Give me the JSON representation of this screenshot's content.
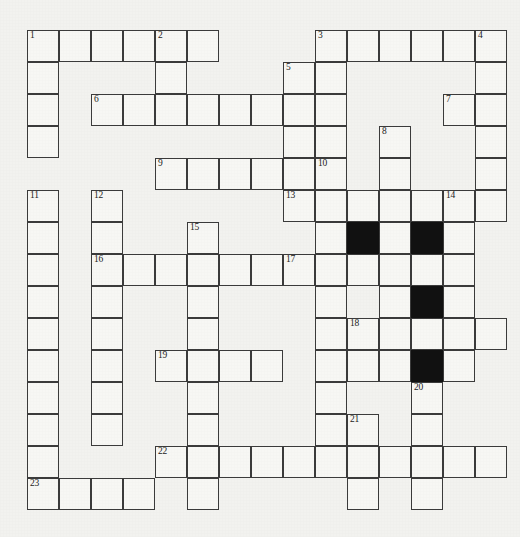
{
  "puzzle": {
    "type": "crossword-grid",
    "title": "Crossword puzzle grid",
    "columns": 15,
    "rows": 16,
    "cell_size": 32,
    "origin_x": 27,
    "origin_y": 30,
    "colors": {
      "page_background": "#f2f2ef",
      "cell_fill": "#f7f7f4",
      "cell_border": "#3b3b3b",
      "block_fill": "#111111",
      "number_color": "#1b1b1b"
    },
    "clue_numbers": [
      {
        "n": "1",
        "col": 0,
        "row": 0
      },
      {
        "n": "2",
        "col": 4,
        "row": 0
      },
      {
        "n": "3",
        "col": 9,
        "row": 0
      },
      {
        "n": "4",
        "col": 14,
        "row": 0
      },
      {
        "n": "5",
        "col": 8,
        "row": 1
      },
      {
        "n": "6",
        "col": 2,
        "row": 2
      },
      {
        "n": "7",
        "col": 13,
        "row": 2
      },
      {
        "n": "8",
        "col": 11,
        "row": 3
      },
      {
        "n": "9",
        "col": 4,
        "row": 4
      },
      {
        "n": "10",
        "col": 9,
        "row": 4
      },
      {
        "n": "11",
        "col": 0,
        "row": 5
      },
      {
        "n": "12",
        "col": 2,
        "row": 5
      },
      {
        "n": "13",
        "col": 8,
        "row": 5
      },
      {
        "n": "14",
        "col": 13,
        "row": 5
      },
      {
        "n": "15",
        "col": 5,
        "row": 6
      },
      {
        "n": "16",
        "col": 2,
        "row": 7
      },
      {
        "n": "17",
        "col": 8,
        "row": 7
      },
      {
        "n": "18",
        "col": 10,
        "row": 9
      },
      {
        "n": "19",
        "col": 4,
        "row": 10
      },
      {
        "n": "20",
        "col": 12,
        "row": 11
      },
      {
        "n": "21",
        "col": 10,
        "row": 12
      },
      {
        "n": "22",
        "col": 4,
        "row": 13
      },
      {
        "n": "23",
        "col": 0,
        "row": 14
      }
    ],
    "blocked_cells": [
      {
        "col": 10,
        "row": 6
      },
      {
        "col": 12,
        "row": 6
      },
      {
        "col": 12,
        "row": 8
      },
      {
        "col": 12,
        "row": 10
      }
    ],
    "open_cells": [
      {
        "col": 0,
        "row": 0
      },
      {
        "col": 1,
        "row": 0
      },
      {
        "col": 2,
        "row": 0
      },
      {
        "col": 3,
        "row": 0
      },
      {
        "col": 4,
        "row": 0
      },
      {
        "col": 5,
        "row": 0
      },
      {
        "col": 9,
        "row": 0
      },
      {
        "col": 10,
        "row": 0
      },
      {
        "col": 11,
        "row": 0
      },
      {
        "col": 12,
        "row": 0
      },
      {
        "col": 13,
        "row": 0
      },
      {
        "col": 14,
        "row": 0
      },
      {
        "col": 0,
        "row": 1
      },
      {
        "col": 4,
        "row": 1
      },
      {
        "col": 8,
        "row": 1
      },
      {
        "col": 9,
        "row": 1
      },
      {
        "col": 14,
        "row": 1
      },
      {
        "col": 0,
        "row": 2
      },
      {
        "col": 2,
        "row": 2
      },
      {
        "col": 3,
        "row": 2
      },
      {
        "col": 4,
        "row": 2
      },
      {
        "col": 5,
        "row": 2
      },
      {
        "col": 6,
        "row": 2
      },
      {
        "col": 7,
        "row": 2
      },
      {
        "col": 8,
        "row": 2
      },
      {
        "col": 9,
        "row": 2
      },
      {
        "col": 13,
        "row": 2
      },
      {
        "col": 14,
        "row": 2
      },
      {
        "col": 0,
        "row": 3
      },
      {
        "col": 8,
        "row": 3
      },
      {
        "col": 9,
        "row": 3
      },
      {
        "col": 11,
        "row": 3
      },
      {
        "col": 14,
        "row": 3
      },
      {
        "col": 4,
        "row": 4
      },
      {
        "col": 5,
        "row": 4
      },
      {
        "col": 6,
        "row": 4
      },
      {
        "col": 7,
        "row": 4
      },
      {
        "col": 8,
        "row": 4
      },
      {
        "col": 9,
        "row": 4
      },
      {
        "col": 11,
        "row": 4
      },
      {
        "col": 14,
        "row": 4
      },
      {
        "col": 0,
        "row": 5
      },
      {
        "col": 2,
        "row": 5
      },
      {
        "col": 8,
        "row": 5
      },
      {
        "col": 9,
        "row": 5
      },
      {
        "col": 10,
        "row": 5
      },
      {
        "col": 11,
        "row": 5
      },
      {
        "col": 12,
        "row": 5
      },
      {
        "col": 13,
        "row": 5
      },
      {
        "col": 14,
        "row": 5
      },
      {
        "col": 0,
        "row": 6
      },
      {
        "col": 2,
        "row": 6
      },
      {
        "col": 5,
        "row": 6
      },
      {
        "col": 9,
        "row": 6
      },
      {
        "col": 11,
        "row": 6
      },
      {
        "col": 13,
        "row": 6
      },
      {
        "col": 0,
        "row": 7
      },
      {
        "col": 2,
        "row": 7
      },
      {
        "col": 3,
        "row": 7
      },
      {
        "col": 4,
        "row": 7
      },
      {
        "col": 5,
        "row": 7
      },
      {
        "col": 6,
        "row": 7
      },
      {
        "col": 7,
        "row": 7
      },
      {
        "col": 8,
        "row": 7
      },
      {
        "col": 9,
        "row": 7
      },
      {
        "col": 10,
        "row": 7
      },
      {
        "col": 11,
        "row": 7
      },
      {
        "col": 12,
        "row": 7
      },
      {
        "col": 13,
        "row": 7
      },
      {
        "col": 0,
        "row": 8
      },
      {
        "col": 2,
        "row": 8
      },
      {
        "col": 5,
        "row": 8
      },
      {
        "col": 9,
        "row": 8
      },
      {
        "col": 11,
        "row": 8
      },
      {
        "col": 13,
        "row": 8
      },
      {
        "col": 0,
        "row": 9
      },
      {
        "col": 2,
        "row": 9
      },
      {
        "col": 5,
        "row": 9
      },
      {
        "col": 9,
        "row": 9
      },
      {
        "col": 10,
        "row": 9
      },
      {
        "col": 11,
        "row": 9
      },
      {
        "col": 12,
        "row": 9
      },
      {
        "col": 13,
        "row": 9
      },
      {
        "col": 14,
        "row": 9
      },
      {
        "col": 0,
        "row": 10
      },
      {
        "col": 2,
        "row": 10
      },
      {
        "col": 4,
        "row": 10
      },
      {
        "col": 5,
        "row": 10
      },
      {
        "col": 6,
        "row": 10
      },
      {
        "col": 7,
        "row": 10
      },
      {
        "col": 9,
        "row": 10
      },
      {
        "col": 10,
        "row": 10
      },
      {
        "col": 11,
        "row": 10
      },
      {
        "col": 13,
        "row": 10
      },
      {
        "col": 0,
        "row": 11
      },
      {
        "col": 2,
        "row": 11
      },
      {
        "col": 5,
        "row": 11
      },
      {
        "col": 9,
        "row": 11
      },
      {
        "col": 12,
        "row": 11
      },
      {
        "col": 0,
        "row": 12
      },
      {
        "col": 2,
        "row": 12
      },
      {
        "col": 5,
        "row": 12
      },
      {
        "col": 9,
        "row": 12
      },
      {
        "col": 10,
        "row": 12
      },
      {
        "col": 12,
        "row": 12
      },
      {
        "col": 0,
        "row": 13
      },
      {
        "col": 4,
        "row": 13
      },
      {
        "col": 5,
        "row": 13
      },
      {
        "col": 6,
        "row": 13
      },
      {
        "col": 7,
        "row": 13
      },
      {
        "col": 8,
        "row": 13
      },
      {
        "col": 9,
        "row": 13
      },
      {
        "col": 10,
        "row": 13
      },
      {
        "col": 11,
        "row": 13
      },
      {
        "col": 12,
        "row": 13
      },
      {
        "col": 13,
        "row": 13
      },
      {
        "col": 14,
        "row": 13
      },
      {
        "col": 0,
        "row": 14
      },
      {
        "col": 1,
        "row": 14
      },
      {
        "col": 2,
        "row": 14
      },
      {
        "col": 3,
        "row": 14
      },
      {
        "col": 5,
        "row": 14
      },
      {
        "col": 10,
        "row": 14
      },
      {
        "col": 12,
        "row": 14
      }
    ]
  }
}
